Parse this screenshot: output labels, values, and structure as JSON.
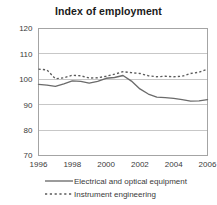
{
  "chart_data": {
    "type": "line",
    "title": "Index of employment",
    "xlabel": "",
    "ylabel": "",
    "x": [
      1996,
      1996.5,
      1997,
      1997.5,
      1998,
      1998.5,
      1999,
      1999.5,
      2000,
      2000.5,
      2001,
      2001.5,
      2002,
      2002.5,
      2003,
      2003.5,
      2004,
      2004.5,
      2005,
      2005.5,
      2006
    ],
    "xlim": [
      1996,
      2006
    ],
    "ylim": [
      70,
      120
    ],
    "xticks": [
      1996,
      1998,
      2000,
      2002,
      2004,
      2006
    ],
    "xtick_labels": [
      "1996",
      "1998",
      "2000",
      "2002",
      "2004",
      "2006"
    ],
    "yticks": [
      70,
      80,
      90,
      100,
      110,
      120
    ],
    "ytick_labels": [
      "70",
      "80",
      "90",
      "100",
      "110",
      "120"
    ],
    "grid": true,
    "grid_axis": "y",
    "legend_position": "bottom",
    "series": [
      {
        "name": "Electrical and optical equipment",
        "style": "solid",
        "color": "#6b6b6b",
        "values": [
          98.0,
          97.7,
          97.2,
          98.2,
          99.4,
          99.2,
          98.5,
          99.2,
          100.4,
          100.7,
          101.5,
          99.3,
          96.2,
          94.2,
          93.0,
          92.8,
          92.5,
          92.0,
          91.4,
          91.5,
          92.0
        ]
      },
      {
        "name": "Instrument engineering",
        "style": "dashed",
        "color": "#5a5a5a",
        "values": [
          104.0,
          103.7,
          100.2,
          100.6,
          101.6,
          101.4,
          100.5,
          100.6,
          101.2,
          102.0,
          103.0,
          102.6,
          102.3,
          101.4,
          101.0,
          101.2,
          101.0,
          101.2,
          102.3,
          102.8,
          104.0
        ]
      }
    ]
  },
  "legend": {
    "entries": [
      {
        "label": "Electrical and optical equipment",
        "style": "solid"
      },
      {
        "label": "Instrument engineering",
        "style": "dashed"
      }
    ]
  }
}
